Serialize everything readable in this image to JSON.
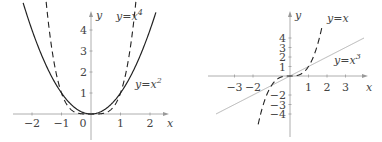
{
  "chart_data": [
    {
      "type": "line",
      "title": "",
      "xlabel": "x",
      "ylabel": "y",
      "xlim": [
        -2.6,
        2.6
      ],
      "ylim": [
        -0.3,
        4.6
      ],
      "x_ticks": [
        "-2",
        "-1",
        "0",
        "1",
        "2"
      ],
      "y_ticks": [
        "1",
        "2",
        "3",
        "4"
      ],
      "grid": false,
      "series": [
        {
          "name": "y=x^2",
          "label": "y=x",
          "label_sup": "2",
          "style": "solid",
          "function": "x^2"
        },
        {
          "name": "y=x^4",
          "label": "y=x",
          "label_sup": "4",
          "style": "dashed",
          "function": "x^4"
        }
      ]
    },
    {
      "type": "line",
      "title": "",
      "xlabel": "x",
      "ylabel": "y",
      "xlim": [
        -3.9,
        3.9
      ],
      "ylim": [
        -5,
        5.2
      ],
      "x_ticks": [
        "-3",
        "-2",
        "1",
        "2",
        "3"
      ],
      "y_ticks": [
        "4",
        "3",
        "2",
        "1",
        "-2",
        "-3",
        "-4"
      ],
      "grid": false,
      "series": [
        {
          "name": "y=x^3",
          "label": "y=x",
          "label_sup": "3",
          "style": "dashed",
          "function": "x^3"
        },
        {
          "name": "y=x",
          "label": "y=x",
          "label_sup": "",
          "style": "solid-light",
          "function": "x"
        }
      ]
    }
  ]
}
